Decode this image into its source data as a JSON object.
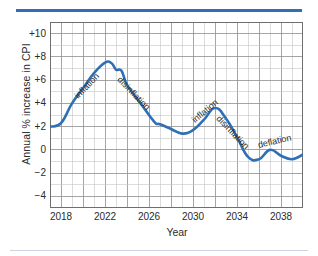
{
  "figure": {
    "top_rule_color": "#2f6fb5",
    "bottom_rule_color": "#c9d4de"
  },
  "chart_data": {
    "type": "line",
    "title": "",
    "xlabel": "Year",
    "ylabel": "Annual % increase in CPI",
    "xlim": [
      2017,
      2040
    ],
    "ylim": [
      -5,
      11
    ],
    "grid": true,
    "grid_major_color": "#8f8f8f",
    "grid_minor_color": "#c4c4c4",
    "legend": "none",
    "line_color": "#2f6fb5",
    "line_width": 2.6,
    "xticks": [
      2018,
      2022,
      2026,
      2030,
      2034,
      2038
    ],
    "xticklabels": [
      "2018",
      "2022",
      "2026",
      "2030",
      "2034",
      "2038"
    ],
    "yticks": [
      10,
      8,
      6,
      4,
      2,
      0,
      -2,
      -4
    ],
    "yticklabels": [
      "+10",
      "+8",
      "+6",
      "+4",
      "+2",
      "0",
      "−2",
      "−4"
    ],
    "series": [
      {
        "name": "Annual % increase in CPI",
        "x": [
          2017,
          2018,
          2019,
          2020,
          2021,
          2022,
          2022.6,
          2023,
          2023.5,
          2024,
          2025,
          2026,
          2026.6,
          2027,
          2028,
          2029,
          2030,
          2031,
          2032,
          2033,
          2034,
          2035,
          2036,
          2037,
          2038,
          2039,
          2040
        ],
        "values": [
          2.0,
          2.3,
          4.0,
          5.3,
          6.6,
          7.5,
          7.45,
          6.9,
          6.8,
          5.6,
          4.3,
          3.0,
          2.3,
          2.2,
          1.8,
          1.4,
          1.7,
          2.6,
          3.6,
          2.7,
          1.1,
          -0.6,
          -0.8,
          0.0,
          -0.5,
          -0.8,
          -0.4
        ]
      }
    ],
    "annotations": [
      {
        "text": "inflation",
        "x": 2019.4,
        "y": 5.0,
        "rotation": -46
      },
      {
        "text": "disinflation",
        "x": 2023.3,
        "y": 6.6,
        "rotation": 46
      },
      {
        "text": "inflation",
        "x": 2030.0,
        "y": 2.9,
        "rotation": -40
      },
      {
        "text": "disinflation",
        "x": 2032.3,
        "y": 3.3,
        "rotation": 46
      },
      {
        "text": "deflation",
        "x": 2035.9,
        "y": 0.85,
        "rotation": -13
      }
    ]
  }
}
